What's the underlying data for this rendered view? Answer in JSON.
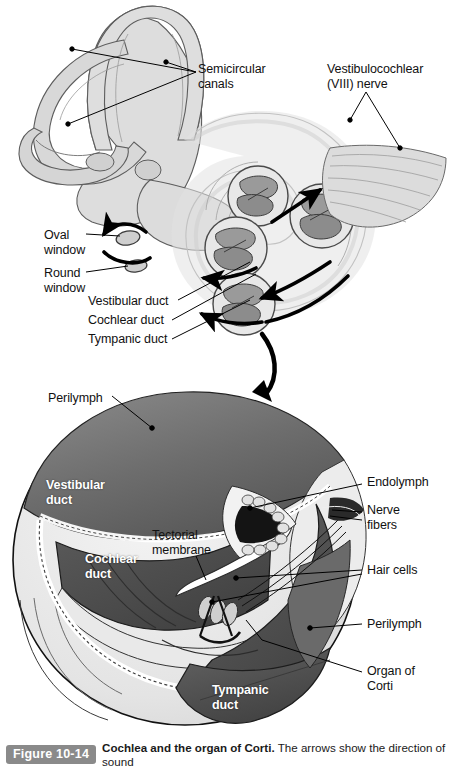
{
  "figure": {
    "badge": "Figure 10-14",
    "title": "Cochlea and the organ of Corti.",
    "description": "The arrows show the direction of sound",
    "badge_color": "#8a8a8a",
    "background_color": "#ffffff"
  },
  "upper_panel": {
    "name": "inner-ear-overview",
    "labels": [
      {
        "id": "semicircular-canals",
        "text": "Semicircular\ncanals",
        "x": 198,
        "y": 62
      },
      {
        "id": "vestibulocochlear-nerve",
        "text": "Vestibulocochlear\n(VIII) nerve",
        "x": 327,
        "y": 62
      },
      {
        "id": "oval-window",
        "text": "Oval\nwindow",
        "x": 44,
        "y": 228
      },
      {
        "id": "round-window",
        "text": "Round\nwindow",
        "x": 44,
        "y": 266
      },
      {
        "id": "vestibular-duct",
        "text": "Vestibular duct",
        "x": 88,
        "y": 301
      },
      {
        "id": "cochlear-duct",
        "text": "Cochlear duct",
        "x": 88,
        "y": 320
      },
      {
        "id": "tympanic-duct",
        "text": "Tympanic duct",
        "x": 88,
        "y": 339
      }
    ]
  },
  "lower_panel": {
    "name": "organ-of-corti-cross-section",
    "outer_labels": [
      {
        "id": "perilymph-top",
        "text": "Perilymph",
        "x": 48,
        "y": 391
      },
      {
        "id": "endolymph",
        "text": "Endolymph",
        "x": 367,
        "y": 481
      },
      {
        "id": "nerve-fibers",
        "text": "Nerve\nfibers",
        "x": 367,
        "y": 508
      },
      {
        "id": "tectorial-membrane",
        "text": "Tectorial\nmembrane",
        "x": 152,
        "y": 534
      },
      {
        "id": "hair-cells",
        "text": "Hair cells",
        "x": 367,
        "y": 568
      },
      {
        "id": "perilymph-right",
        "text": "Perilymph",
        "x": 367,
        "y": 620
      },
      {
        "id": "organ-of-corti",
        "text": "Organ of\nCorti",
        "x": 367,
        "y": 670
      }
    ],
    "inner_labels": [
      {
        "id": "vestibular-duct-inner",
        "text": "Vestibular\nduct",
        "x": 46,
        "y": 484
      },
      {
        "id": "cochlear-duct-inner",
        "text": "Cochlear\nduct",
        "x": 85,
        "y": 558
      },
      {
        "id": "tympanic-duct-inner",
        "text": "Tympanic\nduct",
        "x": 212,
        "y": 689
      }
    ]
  },
  "palette": {
    "bone_light": "#e6e6e6",
    "bone_mid": "#d2d2d2",
    "bone_dark": "#b5b5b5",
    "vestibular_gray": "#6f6f6f",
    "cochlear_dark": "#4a4a4a",
    "tympanic_dark": "#555555",
    "outline": "#111111",
    "white": "#ffffff"
  }
}
